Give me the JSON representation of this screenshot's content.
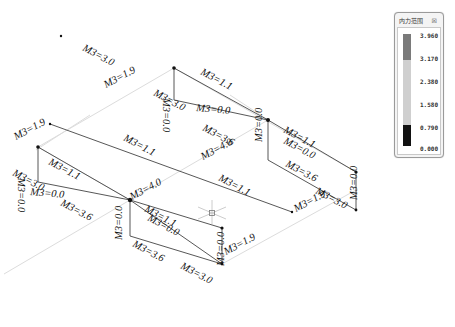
{
  "legend_panel": {
    "title": "内力范围",
    "close_label": "☒",
    "values": [
      "3.960",
      "3.170",
      "2.380",
      "1.580",
      "0.790",
      "0.000"
    ],
    "bands": [
      {
        "from": "3.960",
        "to": "3.170",
        "color": "#7a7a7a"
      },
      {
        "from": "3.170",
        "to": "0.790",
        "color": "#cfcfcf"
      },
      {
        "from": "0.790",
        "to": "0.000",
        "color": "#111111"
      }
    ]
  },
  "diagram": {
    "labels": [
      {
        "text": "M3=3.0",
        "x": 82,
        "y": 50,
        "rot": 28
      },
      {
        "text": "M3=1.1",
        "x": 200,
        "y": 74,
        "rot": 28
      },
      {
        "text": "M3=1.9",
        "x": 106,
        "y": 88,
        "rot": -28
      },
      {
        "text": "M3=0.0",
        "x": 196,
        "y": 111,
        "rot": 5
      },
      {
        "text": "M3=0.0",
        "x": 163,
        "y": 98,
        "rot": 90
      },
      {
        "text": "M3=3.0",
        "x": 153,
        "y": 95,
        "rot": 28
      },
      {
        "text": "M3=3.6",
        "x": 202,
        "y": 130,
        "rot": 28
      },
      {
        "text": "M3=1.9",
        "x": 16,
        "y": 140,
        "rot": -28
      },
      {
        "text": "M3=1.1",
        "x": 123,
        "y": 140,
        "rot": 28
      },
      {
        "text": "M3=4.0",
        "x": 203,
        "y": 160,
        "rot": -28
      },
      {
        "text": "M3=0.0",
        "x": 262,
        "y": 142,
        "rot": -90
      },
      {
        "text": "M3=1.1",
        "x": 283,
        "y": 132,
        "rot": 28
      },
      {
        "text": "M3=0.0",
        "x": 283,
        "y": 143,
        "rot": 28
      },
      {
        "text": "M3=3.6",
        "x": 285,
        "y": 166,
        "rot": 28
      },
      {
        "text": "M3=1.1",
        "x": 48,
        "y": 164,
        "rot": 28
      },
      {
        "text": "M3=0.0",
        "x": 30,
        "y": 195,
        "rot": 5
      },
      {
        "text": "M3=0.0",
        "x": 18,
        "y": 178,
        "rot": 90
      },
      {
        "text": "M3=3.0",
        "x": 12,
        "y": 175,
        "rot": 28
      },
      {
        "text": "M3=1.1",
        "x": 218,
        "y": 180,
        "rot": 28
      },
      {
        "text": "M3=3.6",
        "x": 60,
        "y": 205,
        "rot": 28
      },
      {
        "text": "M3=1.9",
        "x": 296,
        "y": 212,
        "rot": -28
      },
      {
        "text": "M3=3.0",
        "x": 315,
        "y": 193,
        "rot": 28
      },
      {
        "text": "M3=0.0",
        "x": 357,
        "y": 200,
        "rot": -90
      },
      {
        "text": "M3=4.0",
        "x": 132,
        "y": 200,
        "rot": -28
      },
      {
        "text": "M3=1.1",
        "x": 144,
        "y": 211,
        "rot": 28
      },
      {
        "text": "M3=0.0",
        "x": 147,
        "y": 220,
        "rot": 28
      },
      {
        "text": "M3=0.0",
        "x": 122,
        "y": 240,
        "rot": -90
      },
      {
        "text": "M3=3.6",
        "x": 132,
        "y": 246,
        "rot": 28
      },
      {
        "text": "M3=1.9",
        "x": 226,
        "y": 255,
        "rot": -28
      },
      {
        "text": "M3=3.0",
        "x": 180,
        "y": 268,
        "rot": 28
      },
      {
        "text": "M3=0.0",
        "x": 224,
        "y": 266,
        "rot": -90
      }
    ]
  }
}
